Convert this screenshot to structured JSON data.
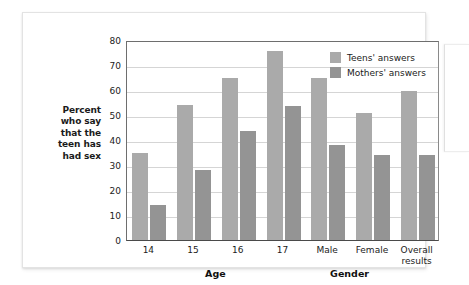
{
  "chart_data": {
    "type": "bar",
    "title": "",
    "subtitle": "",
    "xlabel": "",
    "ylabel": "Percent who say that the teen has had sex",
    "ylim": [
      0,
      80
    ],
    "yticks": [
      0,
      10,
      20,
      30,
      40,
      50,
      60,
      70,
      80
    ],
    "grid": true,
    "legend_position": "top-right",
    "categories": [
      "14",
      "15",
      "16",
      "17",
      "Male",
      "Female",
      "Overall results"
    ],
    "series": [
      {
        "name": "Teens' answers",
        "color": "#aaaaaa",
        "values": [
          35,
          54,
          65,
          75.5,
          65,
          51,
          59.5
        ]
      },
      {
        "name": "Mothers' answers",
        "color": "#949494",
        "values": [
          14,
          28,
          43.5,
          53.5,
          38,
          34,
          34
        ]
      }
    ],
    "group_labels": [
      {
        "label": "Age",
        "spans": [
          "14",
          "15",
          "16",
          "17"
        ]
      },
      {
        "label": "Gender",
        "spans": [
          "Male",
          "Female"
        ]
      }
    ]
  },
  "axis": {
    "y_caption_lines": [
      "Percent",
      "who say",
      "that the",
      "teen has",
      "had sex"
    ],
    "y_caption_text": "Percent who say that the teen has had sex"
  },
  "legend": {
    "items": [
      {
        "label": "Teens' answers",
        "swatch": "teens-swatch"
      },
      {
        "label": "Mothers' answers",
        "swatch": "mothers-swatch"
      }
    ]
  },
  "category_labels": [
    {
      "text": "14",
      "line2": ""
    },
    {
      "text": "15",
      "line2": ""
    },
    {
      "text": "16",
      "line2": ""
    },
    {
      "text": "17",
      "line2": ""
    },
    {
      "text": "Male",
      "line2": ""
    },
    {
      "text": "Female",
      "line2": ""
    },
    {
      "text": "Overall",
      "line2": "results"
    }
  ],
  "group_labels": [
    {
      "text": "Age"
    },
    {
      "text": "Gender"
    }
  ],
  "colors": {
    "teens": "#aaaaaa",
    "mothers": "#949494",
    "grid": "#d5d5d5",
    "axis": "#4a4a4a",
    "card": "#ffffff",
    "page": "#ffffff"
  }
}
